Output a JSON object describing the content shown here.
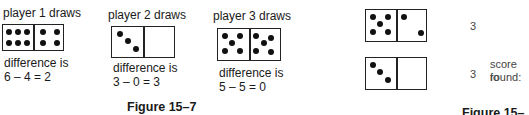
{
  "figure_15_7": {
    "caption": "Figure 15–7",
    "players": [
      {
        "title": "player 1 draws",
        "left_pips": 6,
        "right_pips": 4,
        "diff_label": "difference is",
        "diff_eq": "6 – 4 = 2"
      },
      {
        "title": "player 2 draws",
        "left_pips": 3,
        "right_pips": 0,
        "diff_label": "difference is",
        "diff_eq": "3 – 0 = 3"
      },
      {
        "title": "player 3 draws",
        "left_pips": 5,
        "right_pips": 5,
        "diff_label": "difference is",
        "diff_eq": "5 – 5 = 0"
      }
    ]
  },
  "figure_15_8": {
    "caption": "Figure 15–8",
    "rows": [
      {
        "left_pips": 5,
        "right_pips": 2,
        "value": "3"
      },
      {
        "left_pips": 3,
        "right_pips": 0,
        "value": "3"
      }
    ],
    "score_label_line1": "score fo",
    "score_label_line2": "round:"
  }
}
